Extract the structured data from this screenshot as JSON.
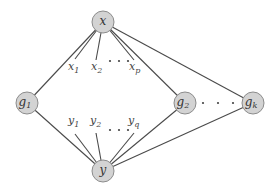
{
  "diagram": {
    "type": "graph",
    "nodes": [
      {
        "id": "x",
        "base": "x",
        "sub": ""
      },
      {
        "id": "g1",
        "base": "g",
        "sub": "1"
      },
      {
        "id": "g2",
        "base": "g",
        "sub": "2"
      },
      {
        "id": "gk",
        "base": "g",
        "sub": "k"
      },
      {
        "id": "y",
        "base": "y",
        "sub": ""
      }
    ],
    "x_leaves": [
      {
        "id": "x1",
        "base": "x",
        "sub": "1"
      },
      {
        "id": "x2",
        "base": "x",
        "sub": "2"
      },
      {
        "id": "xp",
        "base": "x",
        "sub": "p"
      }
    ],
    "y_leaves": [
      {
        "id": "y1",
        "base": "y",
        "sub": "1"
      },
      {
        "id": "y2",
        "base": "y",
        "sub": "2"
      },
      {
        "id": "yq",
        "base": "y",
        "sub": "q"
      }
    ],
    "edges": [
      [
        "x",
        "g1"
      ],
      [
        "x",
        "g2"
      ],
      [
        "x",
        "gk"
      ],
      [
        "y",
        "g1"
      ],
      [
        "y",
        "g2"
      ],
      [
        "y",
        "gk"
      ],
      [
        "x",
        "x1"
      ],
      [
        "x",
        "x2"
      ],
      [
        "x",
        "xp"
      ],
      [
        "y",
        "y1"
      ],
      [
        "y",
        "y2"
      ],
      [
        "y",
        "yq"
      ]
    ],
    "ellipses": [
      "x2-xp",
      "y2-yq",
      "g2-gk"
    ]
  }
}
